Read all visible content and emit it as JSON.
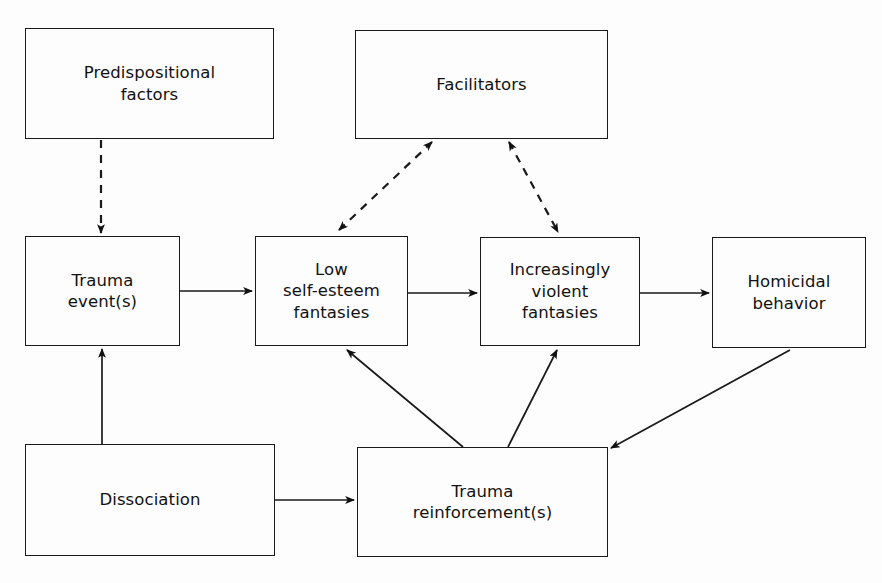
{
  "diagram": {
    "type": "flowchart",
    "canvas": {
      "width": 882,
      "height": 583
    },
    "colors": {
      "background": "#fdfdfd",
      "stroke": "#1a1a1a",
      "text": "#111111"
    },
    "nodes": [
      {
        "id": "predispositional-factors",
        "label": "Predispositional\nfactors",
        "x": 25,
        "y": 28,
        "w": 249,
        "h": 111
      },
      {
        "id": "facilitators",
        "label": "Facilitators",
        "x": 355,
        "y": 30,
        "w": 253,
        "h": 109
      },
      {
        "id": "trauma-events",
        "label": "Trauma\nevent(s)",
        "x": 25,
        "y": 236,
        "w": 155,
        "h": 110
      },
      {
        "id": "low-self-esteem-fantasies",
        "label": "Low\nself-esteem\nfantasies",
        "x": 255,
        "y": 236,
        "w": 153,
        "h": 110
      },
      {
        "id": "increasingly-violent-fantasies",
        "label": "Increasingly\nviolent\nfantasies",
        "x": 480,
        "y": 237,
        "w": 160,
        "h": 109
      },
      {
        "id": "homicidal-behavior",
        "label": "Homicidal\nbehavior",
        "x": 712,
        "y": 237,
        "w": 154,
        "h": 111
      },
      {
        "id": "dissociation",
        "label": "Dissociation",
        "x": 25,
        "y": 444,
        "w": 250,
        "h": 112
      },
      {
        "id": "trauma-reinforcements",
        "label": "Trauma\nreinforcement(s)",
        "x": 357,
        "y": 447,
        "w": 251,
        "h": 110
      }
    ],
    "edges": [
      {
        "id": "predispositional-to-trauma-events",
        "from": "predispositional-factors",
        "to": "trauma-events",
        "style": "dashed",
        "heads": "single",
        "points": [
          [
            101,
            140
          ],
          [
            101,
            233
          ]
        ]
      },
      {
        "id": "trauma-events-to-low-self-esteem",
        "from": "trauma-events",
        "to": "low-self-esteem-fantasies",
        "style": "solid",
        "heads": "single",
        "points": [
          [
            180,
            291
          ],
          [
            252,
            291
          ]
        ]
      },
      {
        "id": "low-self-esteem-to-violent-fantasies",
        "from": "low-self-esteem-fantasies",
        "to": "increasingly-violent-fantasies",
        "style": "solid",
        "heads": "single",
        "points": [
          [
            408,
            293
          ],
          [
            477,
            293
          ]
        ]
      },
      {
        "id": "violent-fantasies-to-homicidal",
        "from": "increasingly-violent-fantasies",
        "to": "homicidal-behavior",
        "style": "solid",
        "heads": "single",
        "points": [
          [
            640,
            293
          ],
          [
            709,
            293
          ]
        ]
      },
      {
        "id": "low-self-esteem-facilitators",
        "from": "low-self-esteem-fantasies",
        "to": "facilitators",
        "style": "dashed",
        "heads": "double",
        "points": [
          [
            339,
            230
          ],
          [
            432,
            142
          ]
        ]
      },
      {
        "id": "facilitators-violent-fantasies",
        "from": "facilitators",
        "to": "increasingly-violent-fantasies",
        "style": "dashed",
        "heads": "double",
        "points": [
          [
            509,
            142
          ],
          [
            558,
            232
          ]
        ]
      },
      {
        "id": "dissociation-to-trauma-events",
        "from": "dissociation",
        "to": "trauma-events",
        "style": "solid",
        "heads": "single",
        "points": [
          [
            102,
            444
          ],
          [
            102,
            349
          ]
        ]
      },
      {
        "id": "dissociation-to-trauma-reinforcements",
        "from": "dissociation",
        "to": "trauma-reinforcements",
        "style": "solid",
        "heads": "single",
        "points": [
          [
            275,
            500
          ],
          [
            354,
            500
          ]
        ]
      },
      {
        "id": "reinforcements-to-low-self-esteem",
        "from": "trauma-reinforcements",
        "to": "low-self-esteem-fantasies",
        "style": "solid",
        "heads": "single",
        "points": [
          [
            463,
            447
          ],
          [
            347,
            350
          ]
        ]
      },
      {
        "id": "reinforcements-to-violent-fantasies",
        "from": "trauma-reinforcements",
        "to": "increasingly-violent-fantasies",
        "style": "solid",
        "heads": "single",
        "points": [
          [
            508,
            447
          ],
          [
            557,
            350
          ]
        ]
      },
      {
        "id": "homicidal-to-reinforcements",
        "from": "homicidal-behavior",
        "to": "trauma-reinforcements",
        "style": "solid",
        "heads": "single",
        "points": [
          [
            790,
            350
          ],
          [
            611,
            448
          ]
        ]
      }
    ]
  }
}
